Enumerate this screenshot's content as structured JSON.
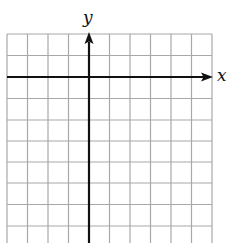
{
  "diagram": {
    "type": "coordinate-grid",
    "x_axis_label": "x",
    "y_axis_label": "y",
    "grid": {
      "columns": 10,
      "rows_visible": 10,
      "line_color": "#a8a8a8",
      "axis_color": "#111111"
    },
    "origin_cell": {
      "col": 4,
      "row": 2
    }
  }
}
